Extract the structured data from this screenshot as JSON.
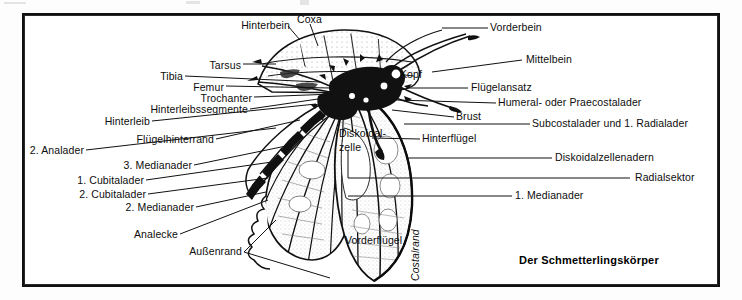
{
  "figure": {
    "title": "Der Schmetterlingskörper",
    "frame_color": "#111111",
    "background_color": "#ffffff",
    "text_color": "#0d0d0d"
  },
  "labels_left": [
    {
      "text": "Hinterbein",
      "x": 236,
      "y": 26
    },
    {
      "text": "Coxa",
      "x": 297,
      "y": 20
    },
    {
      "text": "Tarsus",
      "x": 203,
      "y": 66
    },
    {
      "text": "Tibia",
      "x": 160,
      "y": 77
    },
    {
      "text": "Femur",
      "x": 190,
      "y": 88
    },
    {
      "text": "Trochanter",
      "x": 190,
      "y": 99
    },
    {
      "text": "Hinterleibssegmente",
      "x": 165,
      "y": 111
    },
    {
      "text": "Hinterleib",
      "x": 115,
      "y": 123
    },
    {
      "text": "Flügelhinterrand",
      "x": 140,
      "y": 141
    },
    {
      "text": "2. Analader",
      "x": 28,
      "y": 152
    },
    {
      "text": "3. Medianader",
      "x": 120,
      "y": 167
    },
    {
      "text": "1. Cubitalader",
      "x": 82,
      "y": 182
    },
    {
      "text": "2. Cubitalader",
      "x": 82,
      "y": 196
    },
    {
      "text": "2. Medianader",
      "x": 128,
      "y": 209
    },
    {
      "text": "Analecke",
      "x": 128,
      "y": 236
    },
    {
      "text": "Außenrand",
      "x": 196,
      "y": 253
    }
  ],
  "labels_right": [
    {
      "text": "Vorderbein",
      "x": 493,
      "y": 29
    },
    {
      "text": "Mittelbein",
      "x": 527,
      "y": 61
    },
    {
      "text": "Flügelansatz",
      "x": 473,
      "y": 89
    },
    {
      "text": "Humeral- oder Praecostalader",
      "x": 500,
      "y": 104
    },
    {
      "text": "Brust",
      "x": 459,
      "y": 118
    },
    {
      "text": "Subcostalader und 1. Radialader",
      "x": 535,
      "y": 125
    },
    {
      "text": "Hinterflügel",
      "x": 425,
      "y": 140
    },
    {
      "text": "Diskoidalzellenadern",
      "x": 557,
      "y": 159
    },
    {
      "text": "Radialsektor",
      "x": 637,
      "y": 179
    },
    {
      "text": "1. Medianader",
      "x": 517,
      "y": 197
    }
  ],
  "labels_inner": [
    {
      "text": "Kopf",
      "x": 400,
      "y": 75
    },
    {
      "text": "Diskoidal-",
      "x": 341,
      "y": 134
    },
    {
      "text": "zelle",
      "x": 341,
      "y": 148
    },
    {
      "text": "Vorderflügel",
      "x": 347,
      "y": 241
    }
  ],
  "labels_rotated": [
    {
      "text": "Costalrand",
      "x": 407,
      "y": 280
    }
  ],
  "artwork": {
    "subject": "butterfly-ventral-view",
    "description": "line-drawing of a butterfly body with head, thorax, segmented abdomen, legs and veined wings"
  }
}
